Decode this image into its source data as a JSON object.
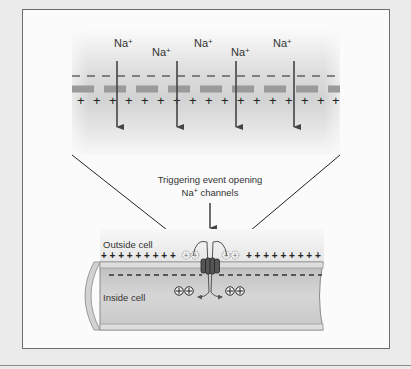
{
  "figure": {
    "top_panel": {
      "ion_labels": [
        {
          "text": "Na",
          "sup": "+",
          "x": 106,
          "y": 47
        },
        {
          "text": "Na",
          "sup": "+",
          "x": 151,
          "y": 56
        },
        {
          "text": "Na",
          "sup": "+",
          "x": 194,
          "y": 47
        },
        {
          "text": "Na",
          "sup": "+",
          "x": 231,
          "y": 56
        },
        {
          "text": "Na",
          "sup": "+",
          "x": 273,
          "y": 47
        }
      ],
      "outer_charge": "−",
      "inner_charge": "+"
    },
    "annotation": {
      "line1": "Triggering event opening",
      "line2_main": "Na",
      "line2_sup": "+",
      "line2_rest": " channels"
    },
    "bottom_panel": {
      "outside_label": "Outside cell",
      "inside_label": "Inside cell"
    },
    "colors": {
      "membrane_band": "#9a9a9a",
      "arrow": "#444444",
      "cell_fill": "#c4c4c4",
      "channel": "#555555"
    }
  }
}
